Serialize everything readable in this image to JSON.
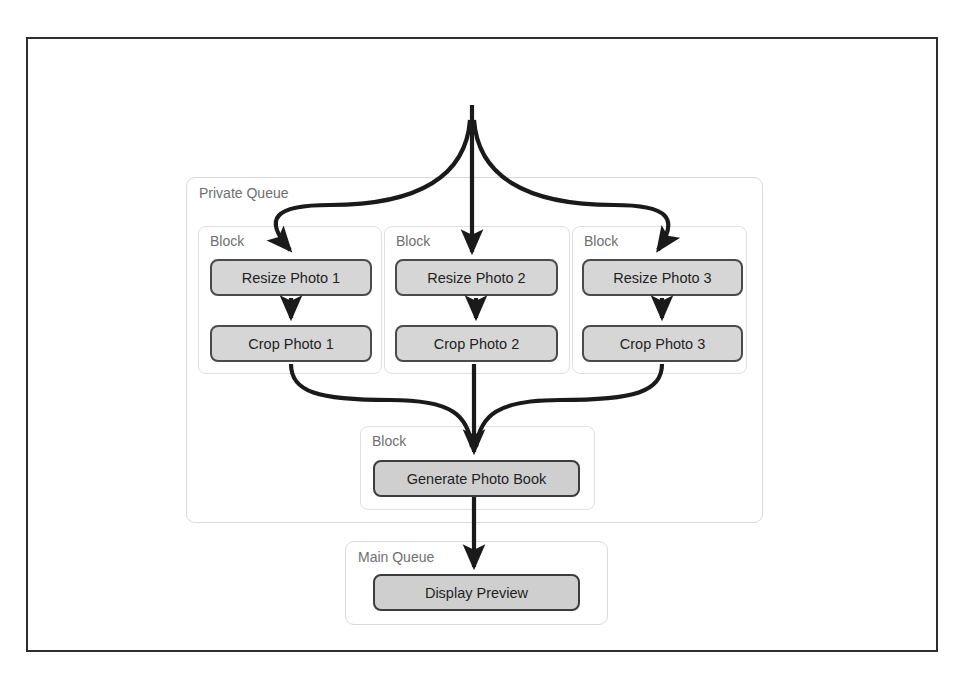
{
  "figure": {
    "title": "Concurrent Approach",
    "frame": {
      "x": 26,
      "y": 37,
      "width": 912,
      "height": 615
    }
  },
  "private_queue": {
    "label": "Private Queue",
    "x": 186,
    "y": 177,
    "width": 577,
    "height": 346,
    "blocks": [
      {
        "label": "Block",
        "x": 198,
        "y": 226,
        "width": 184,
        "height": 148,
        "nodes": [
          {
            "label": "Resize Photo 1",
            "x": 210,
            "y": 259,
            "width": 162,
            "height": 37
          },
          {
            "label": "Crop Photo 1",
            "x": 210,
            "y": 325,
            "width": 162,
            "height": 37
          }
        ]
      },
      {
        "label": "Block",
        "x": 384,
        "y": 226,
        "width": 186,
        "height": 148,
        "nodes": [
          {
            "label": "Resize Photo 2",
            "x": 395,
            "y": 259,
            "width": 163,
            "height": 37
          },
          {
            "label": "Crop Photo 2",
            "x": 395,
            "y": 325,
            "width": 163,
            "height": 37
          }
        ]
      },
      {
        "label": "Block",
        "x": 572,
        "y": 226,
        "width": 175,
        "height": 148,
        "nodes": [
          {
            "label": "Resize Photo 3",
            "x": 582,
            "y": 259,
            "width": 161,
            "height": 37
          },
          {
            "label": "Crop Photo 3",
            "x": 582,
            "y": 325,
            "width": 161,
            "height": 37
          }
        ]
      }
    ],
    "merge_block": {
      "label": "Block",
      "x": 360,
      "y": 426,
      "width": 235,
      "height": 84,
      "nodes": [
        {
          "label": "Generate Photo Book",
          "x": 373,
          "y": 460,
          "width": 207,
          "height": 37
        }
      ]
    }
  },
  "main_queue": {
    "label": "Main Queue",
    "x": 345,
    "y": 541,
    "width": 263,
    "height": 84,
    "nodes": [
      {
        "label": "Display Preview",
        "x": 373,
        "y": 574,
        "width": 207,
        "height": 37
      }
    ]
  },
  "colors": {
    "frame_border": "#2e2e2e",
    "node_fill": "#d6d6d6",
    "node_border": "#4a4a4a",
    "group_border": "#d9d9d9",
    "block_border": "#e0e0e0",
    "connector": "#1a1a1a",
    "label_text": "#6f6f6f",
    "title_text": "#333333",
    "page_background": "#ffffff"
  },
  "connectors": {
    "fan_out_description": "single input splits into three parallel branches",
    "fan_in_description": "three parallel branches merge into one",
    "branch_count": 3
  }
}
